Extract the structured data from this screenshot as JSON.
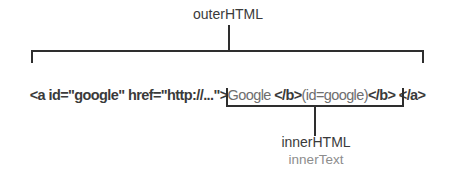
{
  "diagram": {
    "outer_label": "outerHTML",
    "inner_html_label": "innerHTML",
    "inner_text_label": "innerText",
    "code": {
      "open_tag": "<a id=\"google\" href=\"http://...\">",
      "link_text": "Google ",
      "bold_close_tag_1": "</b>",
      "id_text": "(id=google)",
      "bold_close_tag_2": "</b>",
      "gap": " ",
      "anchor_close_tag": "</a>"
    },
    "colors": {
      "line": "#2e2e2e",
      "tag_text": "#3a3a3a",
      "content_text": "#6e6e6e",
      "label_dark": "#3a3a3a",
      "label_gray": "#8d8d8d",
      "background": "#ffffff"
    }
  }
}
